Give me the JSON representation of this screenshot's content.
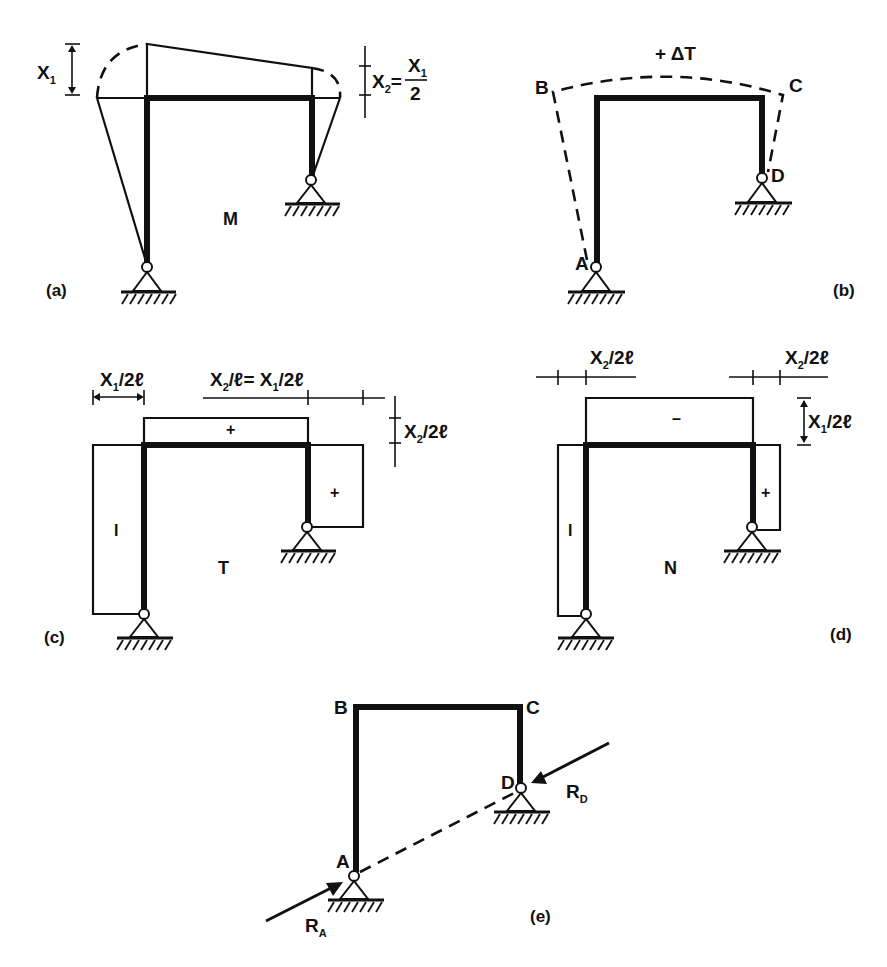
{
  "panels": {
    "a": {
      "caption": "(a)",
      "diagram_label": "M",
      "dim_left": {
        "var": "X",
        "sub": "1"
      },
      "dim_right": {
        "var": "X",
        "sub": "2",
        "eq": "=",
        "num_var": "X",
        "num_sub": "1",
        "den": "2"
      }
    },
    "b": {
      "caption": "(b)",
      "load_label": "+ ΔT",
      "nodes": {
        "A": "A",
        "B": "B",
        "C": "C",
        "D": "D"
      }
    },
    "c": {
      "caption": "(c)",
      "diagram_label": "T",
      "dim_left": {
        "var": "X",
        "sub": "1",
        "rest": "/2ℓ"
      },
      "dim_top": {
        "var": "X",
        "sub": "2",
        "mid": "/ℓ= X",
        "sub2": "1",
        "rest": "/2ℓ"
      },
      "dim_right": {
        "var": "X",
        "sub": "2",
        "rest": "/2ℓ"
      },
      "signs": {
        "beam": "+",
        "right_column": "+",
        "left_column": "I"
      }
    },
    "d": {
      "caption": "(d)",
      "diagram_label": "N",
      "dim_top_left": {
        "var": "X",
        "sub": "2",
        "rest": "/2ℓ"
      },
      "dim_top_right": {
        "var": "X",
        "sub": "2",
        "rest": "/2ℓ"
      },
      "dim_right": {
        "var": "X",
        "sub": "1",
        "rest": "/2ℓ"
      },
      "signs": {
        "beam": "–",
        "right_column": "+",
        "left_column": "I"
      }
    },
    "e": {
      "caption": "(e)",
      "nodes": {
        "A": "A",
        "B": "B",
        "C": "C",
        "D": "D"
      },
      "reactions": {
        "RA": {
          "var": "R",
          "sub": "A"
        },
        "RD": {
          "var": "R",
          "sub": "D"
        }
      }
    }
  }
}
